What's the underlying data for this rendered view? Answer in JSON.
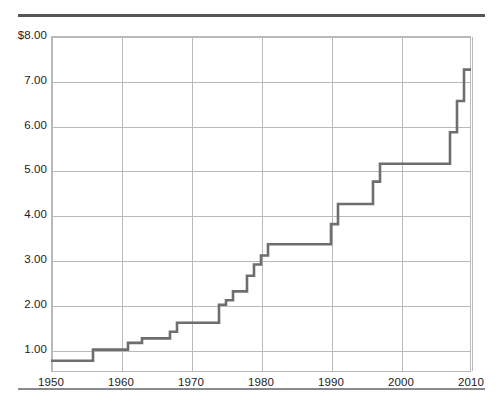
{
  "figure": {
    "rule_top": "horizontal-rule",
    "rule_bottom": "horizontal-rule"
  },
  "chart_data": {
    "type": "line",
    "subtype": "step-post",
    "title": "",
    "subtitle": "",
    "xlabel": "",
    "ylabel": "",
    "xlim": [
      1950,
      2010
    ],
    "ylim": [
      0.5,
      8.0
    ],
    "grid": true,
    "legend": null,
    "x_tick_labels": [
      "1950",
      "1960",
      "1970",
      "1980",
      "1990",
      "2000",
      "2010"
    ],
    "x_tick_values": [
      1950,
      1960,
      1970,
      1980,
      1990,
      2000,
      2010
    ],
    "y_tick_labels": [
      "$8.00",
      "7.00",
      "6.00",
      "5.00",
      "4.00",
      "3.00",
      "2.00",
      "1.00"
    ],
    "y_tick_values": [
      8.0,
      7.0,
      6.0,
      5.0,
      4.0,
      3.0,
      2.0,
      1.0
    ],
    "series": [
      {
        "name": "value",
        "color": "#6d6e70",
        "x": [
          1950,
          1956,
          1961,
          1963,
          1967,
          1968,
          1974,
          1975,
          1976,
          1978,
          1979,
          1980,
          1981,
          1990,
          1991,
          1996,
          1997,
          2007,
          2008,
          2009,
          2010
        ],
        "values": [
          0.75,
          1.0,
          1.15,
          1.25,
          1.4,
          1.6,
          2.0,
          2.1,
          2.3,
          2.65,
          2.9,
          3.1,
          3.35,
          3.8,
          4.25,
          4.75,
          5.15,
          5.85,
          6.55,
          7.25,
          7.25
        ]
      }
    ]
  }
}
